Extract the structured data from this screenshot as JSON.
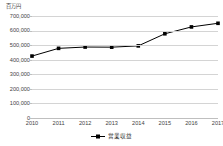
{
  "chart_data": {
    "type": "line",
    "title": "",
    "unit_label": "百万円",
    "xlabel": "",
    "ylabel": "",
    "categories": [
      "2010",
      "2011",
      "2012",
      "2013",
      "2014",
      "2015",
      "2016",
      "2017"
    ],
    "series": [
      {
        "name": "営業収益",
        "values": [
          425000,
          478000,
          487000,
          486000,
          495000,
          578000,
          625000,
          650000
        ],
        "color": "#000000",
        "marker": "square"
      }
    ],
    "ylim": [
      0,
      700000
    ],
    "ytick_labels": [
      "0",
      "100,000",
      "200,000",
      "300,000",
      "400,000",
      "500,000",
      "600,000",
      "700,000"
    ],
    "ytick_values": [
      0,
      100000,
      200000,
      300000,
      400000,
      500000,
      600000,
      700000
    ],
    "grid": true,
    "legend_position": "bottom"
  },
  "legend": {
    "entries": [
      {
        "label": "営業収益",
        "marker_name": "line-marker-square"
      }
    ]
  }
}
